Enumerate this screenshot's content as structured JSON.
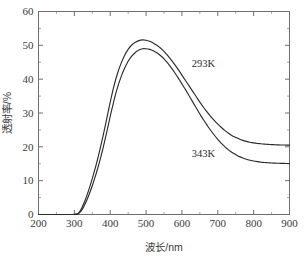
{
  "chart_data": {
    "type": "line",
    "title": "",
    "xlabel": "波长/nm",
    "ylabel": "透射率/%",
    "xlim": [
      200,
      900
    ],
    "ylim": [
      0,
      60
    ],
    "xticks": [
      200,
      300,
      400,
      500,
      600,
      700,
      800,
      900
    ],
    "yticks": [
      0,
      10,
      20,
      30,
      40,
      50,
      60
    ],
    "xtick_labels": [
      "200",
      "300",
      "400",
      "500",
      "600",
      "700",
      "800",
      "900"
    ],
    "ytick_labels": [
      "0",
      "10",
      "20",
      "30",
      "40",
      "50",
      "60"
    ],
    "x_minor_step": 50,
    "y_minor_step": 5,
    "grid": false,
    "legend_position": "inline-annotations",
    "series": [
      {
        "name": "293K",
        "color": "#2b2b2b",
        "label_x": 660,
        "label_y": 43.5,
        "x": [
          200,
          220,
          240,
          260,
          280,
          295,
          305,
          312,
          320,
          330,
          340,
          350,
          360,
          370,
          380,
          390,
          400,
          410,
          420,
          430,
          440,
          450,
          460,
          470,
          480,
          490,
          500,
          510,
          520,
          530,
          540,
          550,
          560,
          570,
          580,
          590,
          600,
          610,
          620,
          630,
          640,
          650,
          660,
          670,
          680,
          690,
          700,
          710,
          720,
          730,
          740,
          750,
          760,
          770,
          780,
          790,
          800,
          810,
          820,
          830,
          840,
          850,
          860,
          870,
          880,
          890,
          900
        ],
        "y": [
          0.0,
          0.0,
          0.0,
          0.0,
          0.0,
          0.0,
          0.1,
          0.5,
          1.8,
          4.2,
          7.2,
          10.6,
          14.4,
          18.6,
          23.2,
          28.2,
          33.2,
          37.8,
          41.6,
          44.6,
          47.0,
          48.8,
          50.1,
          50.9,
          51.4,
          51.6,
          51.5,
          51.2,
          50.7,
          50.0,
          49.2,
          48.2,
          47.0,
          45.7,
          44.3,
          42.8,
          41.2,
          39.6,
          38.0,
          36.4,
          34.8,
          33.2,
          31.7,
          30.3,
          29.0,
          27.8,
          26.7,
          25.7,
          24.8,
          24.0,
          23.3,
          22.8,
          22.3,
          21.9,
          21.6,
          21.35,
          21.15,
          21.0,
          20.9,
          20.8,
          20.72,
          20.66,
          20.61,
          20.57,
          20.54,
          20.52,
          20.5
        ]
      },
      {
        "name": "343K",
        "color": "#2b2b2b",
        "label_x": 660,
        "label_y": 17.0,
        "x": [
          200,
          220,
          240,
          260,
          280,
          295,
          305,
          312,
          320,
          330,
          340,
          350,
          360,
          370,
          380,
          390,
          400,
          410,
          420,
          430,
          440,
          450,
          460,
          470,
          480,
          490,
          500,
          510,
          520,
          530,
          540,
          550,
          560,
          570,
          580,
          590,
          600,
          610,
          620,
          630,
          640,
          650,
          660,
          670,
          680,
          690,
          700,
          710,
          720,
          730,
          740,
          750,
          760,
          770,
          780,
          790,
          800,
          810,
          820,
          830,
          840,
          850,
          860,
          870,
          880,
          890,
          900
        ],
        "y": [
          0.0,
          0.0,
          0.0,
          0.0,
          0.0,
          0.0,
          0.05,
          0.3,
          1.2,
          3.1,
          5.6,
          8.5,
          11.8,
          15.5,
          19.6,
          24.2,
          29.0,
          33.5,
          37.4,
          40.6,
          43.2,
          45.3,
          46.8,
          47.9,
          48.6,
          49.0,
          49.0,
          48.8,
          48.4,
          47.8,
          47.0,
          46.0,
          44.8,
          43.4,
          41.9,
          40.3,
          38.6,
          36.9,
          35.1,
          33.3,
          31.5,
          29.7,
          28.0,
          26.4,
          24.9,
          23.5,
          22.2,
          21.0,
          20.0,
          19.1,
          18.3,
          17.7,
          17.1,
          16.7,
          16.35,
          16.05,
          15.8,
          15.62,
          15.48,
          15.37,
          15.29,
          15.23,
          15.18,
          15.14,
          15.11,
          15.09,
          15.07
        ]
      }
    ]
  }
}
